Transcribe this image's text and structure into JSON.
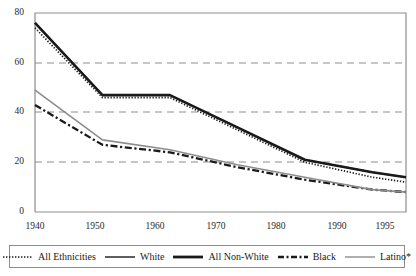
{
  "chart_data": {
    "type": "line",
    "title": "",
    "subtitle": "",
    "xlabel": "",
    "ylabel": "",
    "x": [
      1940,
      1950,
      1960,
      1970,
      1980,
      1990,
      1995
    ],
    "xticklabels": [
      "1940",
      "1950",
      "1960",
      "1970",
      "1980",
      "1990",
      "1995"
    ],
    "yticklabels": [
      "0",
      "20",
      "40",
      "60",
      "80"
    ],
    "yticks": [
      0,
      20,
      40,
      60,
      80
    ],
    "ylim": [
      0,
      80
    ],
    "xlim": [
      1940,
      1995
    ],
    "grid": "horizontal-dashed-at-20-40-60",
    "legend_position": "bottom-boxed",
    "series": [
      {
        "name": "All Ethnicities",
        "style": "dotted",
        "color": "#1a1a1a",
        "values": [
          74,
          46,
          46,
          33,
          20,
          14,
          12
        ]
      },
      {
        "name": "White",
        "style": "solid-thin",
        "color": "#1a1a1a",
        "values": [
          76,
          47,
          47,
          34,
          21,
          16,
          14
        ]
      },
      {
        "name": "All Non-White",
        "style": "solid-thick",
        "color": "#1a1a1a",
        "values": [
          76,
          47,
          47,
          34,
          21,
          16,
          14
        ]
      },
      {
        "name": "Black",
        "style": "dash-dot",
        "color": "#1a1a1a",
        "values": [
          43,
          27,
          24,
          18,
          13,
          9,
          8
        ]
      },
      {
        "name": "Latino*",
        "style": "solid-gray",
        "color": "#8d8d8d",
        "values": [
          49,
          29,
          25,
          19,
          14,
          9,
          8
        ]
      }
    ]
  },
  "legend": {
    "items": [
      {
        "label": "All Ethnicities",
        "icon": "dotted-line-swatch"
      },
      {
        "label": "White",
        "icon": "thin-solid-line-swatch"
      },
      {
        "label": "All Non-White",
        "icon": "thick-solid-line-swatch"
      },
      {
        "label": "Black",
        "icon": "dash-dot-line-swatch"
      },
      {
        "label": "Latino*",
        "icon": "gray-solid-line-swatch"
      }
    ]
  },
  "colors": {
    "axis": "#8d8d8d",
    "grid": "#8d8d8d",
    "line_black": "#1a1a1a",
    "line_gray": "#8d8d8d",
    "legend_border": "#8d8d8d",
    "background": "#ffffff"
  }
}
